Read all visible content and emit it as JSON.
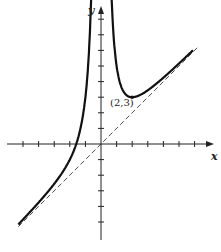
{
  "chart_data": {
    "type": "line",
    "title": "",
    "xlabel": "x",
    "ylabel": "y",
    "function": "y = x + 4/x^2",
    "xlim": [
      -5.5,
      7
    ],
    "ylim": [
      -6,
      9
    ],
    "grid": false,
    "x_ticks": [
      -5,
      -4,
      -3,
      -2,
      -1,
      1,
      2,
      3,
      4,
      5,
      6
    ],
    "y_ticks": [
      -5,
      -4,
      -3,
      -2,
      -1,
      1,
      2,
      3,
      4,
      5,
      6,
      7,
      8
    ],
    "series": [
      {
        "name": "curve",
        "style": "solid-thick",
        "formula": "x + 4/x^2"
      },
      {
        "name": "asymptote",
        "style": "dashed",
        "formula": "y = x"
      }
    ],
    "annotations": [
      {
        "x": 2,
        "y": 3,
        "text": "(2,3)",
        "kind": "local-minimum"
      }
    ]
  },
  "labels": {
    "x_axis": "x",
    "y_axis": "y",
    "min_point": "(2,3)"
  },
  "colors": {
    "ink": "#111111"
  }
}
